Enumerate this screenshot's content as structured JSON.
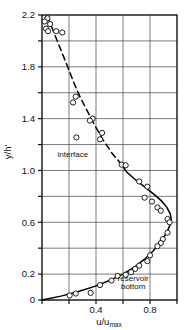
{
  "chart_data": {
    "type": "scatter",
    "title": "",
    "xlabel": "u/umax",
    "ylabel": "y/h'",
    "xlim": [
      0,
      1.0
    ],
    "ylim": [
      0,
      2.2
    ],
    "grid": true,
    "legend_position": "none",
    "x_ticks": [
      0,
      0.2,
      0.4,
      0.6,
      0.8,
      1.0
    ],
    "x_tick_labels": [
      "",
      "",
      "0.4",
      "",
      "0.8",
      ""
    ],
    "x_tick_labels_shown": [
      "0.4",
      "0.8"
    ],
    "y_ticks": [
      0,
      0.2,
      0.4,
      0.6,
      0.8,
      1.0,
      1.2,
      1.4,
      1.6,
      1.8,
      2.0,
      2.2
    ],
    "y_tick_labels_shown": [
      "2.2",
      "1.8",
      "1.4",
      "1.0",
      "0.6",
      "0.2",
      "0"
    ],
    "series": [
      {
        "name": "measured data",
        "marker": "open-circle",
        "points": [
          [
            0.04,
            2.175
          ],
          [
            0.02,
            2.15
          ],
          [
            0.06,
            2.13
          ],
          [
            0.03,
            2.095
          ],
          [
            0.045,
            2.075
          ],
          [
            0.105,
            2.075
          ],
          [
            0.15,
            2.065
          ],
          [
            0.25,
            1.57
          ],
          [
            0.23,
            1.525
          ],
          [
            0.375,
            1.4
          ],
          [
            0.355,
            1.385
          ],
          [
            0.255,
            1.255
          ],
          [
            0.445,
            1.29
          ],
          [
            0.43,
            1.24
          ],
          [
            0.59,
            1.045
          ],
          [
            0.62,
            1.04
          ],
          [
            0.72,
            0.915
          ],
          [
            0.78,
            0.875
          ],
          [
            0.76,
            0.79
          ],
          [
            0.815,
            0.76
          ],
          [
            0.855,
            0.715
          ],
          [
            0.88,
            0.69
          ],
          [
            0.93,
            0.625
          ],
          [
            0.945,
            0.6
          ],
          [
            0.93,
            0.52
          ],
          [
            0.895,
            0.47
          ],
          [
            0.88,
            0.44
          ],
          [
            0.855,
            0.415
          ],
          [
            0.8,
            0.345
          ],
          [
            0.78,
            0.3
          ],
          [
            0.72,
            0.265
          ],
          [
            0.69,
            0.24
          ],
          [
            0.66,
            0.215
          ],
          [
            0.62,
            0.195
          ],
          [
            0.56,
            0.185
          ],
          [
            0.515,
            0.15
          ],
          [
            0.43,
            0.115
          ],
          [
            0.36,
            0.055
          ],
          [
            0.25,
            0.05
          ],
          [
            0.205,
            0.035
          ]
        ]
      }
    ],
    "curves": [
      {
        "name": "reservoir-bottom-profile",
        "style": "solid",
        "points": [
          [
            0.0,
            0.0
          ],
          [
            0.14,
            0.03
          ],
          [
            0.27,
            0.065
          ],
          [
            0.39,
            0.105
          ],
          [
            0.5,
            0.15
          ],
          [
            0.6,
            0.2
          ],
          [
            0.685,
            0.255
          ],
          [
            0.76,
            0.315
          ],
          [
            0.825,
            0.38
          ],
          [
            0.88,
            0.45
          ],
          [
            0.92,
            0.515
          ],
          [
            0.945,
            0.57
          ],
          [
            0.958,
            0.615
          ],
          [
            0.95,
            0.665
          ],
          [
            0.925,
            0.715
          ],
          [
            0.885,
            0.765
          ],
          [
            0.83,
            0.815
          ],
          [
            0.765,
            0.87
          ],
          [
            0.69,
            0.93
          ],
          [
            0.625,
            0.99
          ],
          [
            0.592,
            1.045
          ]
        ]
      },
      {
        "name": "interface-profile",
        "style": "dashed",
        "points": [
          [
            0.592,
            1.045
          ],
          [
            0.52,
            1.13
          ],
          [
            0.45,
            1.24
          ],
          [
            0.39,
            1.35
          ],
          [
            0.34,
            1.45
          ],
          [
            0.285,
            1.56
          ],
          [
            0.235,
            1.68
          ],
          [
            0.19,
            1.8
          ],
          [
            0.14,
            1.93
          ],
          [
            0.09,
            2.06
          ],
          [
            0.045,
            2.18
          ],
          [
            0.03,
            2.2
          ]
        ]
      }
    ],
    "annotations": [
      {
        "name": "interface",
        "text": "interface",
        "x": 0.115,
        "y": 1.105
      },
      {
        "name": "reservoir-bottom-line1",
        "text": "reservoir",
        "x": 0.56,
        "y": 0.15
      },
      {
        "name": "reservoir-bottom-line2",
        "text": "bottom",
        "x": 0.585,
        "y": 0.085
      }
    ],
    "colors": {
      "axis": "#111111",
      "grid": "#444444",
      "curve": "#000000",
      "marker_stroke": "#111111",
      "marker_fill": "#ffffff",
      "background": "#ffffff"
    }
  },
  "axis_labels": {
    "x_main": "u/u",
    "x_sub": "max",
    "y": "y/h'"
  }
}
